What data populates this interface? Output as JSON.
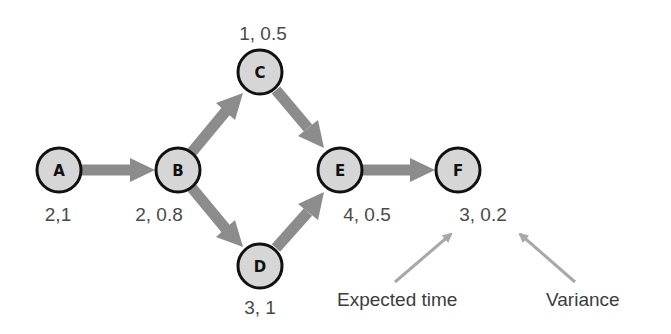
{
  "diagram": {
    "type": "PERT activity network",
    "nodes": [
      {
        "id": "A",
        "label": "A",
        "values": "2,1",
        "expected_time": 2,
        "variance": 1
      },
      {
        "id": "B",
        "label": "B",
        "values": "2, 0.8",
        "expected_time": 2,
        "variance": 0.8
      },
      {
        "id": "C",
        "label": "C",
        "values": "1, 0.5",
        "expected_time": 1,
        "variance": 0.5
      },
      {
        "id": "D",
        "label": "D",
        "values": "3, 1",
        "expected_time": 3,
        "variance": 1
      },
      {
        "id": "E",
        "label": "E",
        "values": "4, 0.5",
        "expected_time": 4,
        "variance": 0.5
      },
      {
        "id": "F",
        "label": "F",
        "values": "3, 0.2",
        "expected_time": 3,
        "variance": 0.2
      }
    ],
    "edges": [
      {
        "from": "A",
        "to": "B"
      },
      {
        "from": "B",
        "to": "C"
      },
      {
        "from": "B",
        "to": "D"
      },
      {
        "from": "C",
        "to": "E"
      },
      {
        "from": "D",
        "to": "E"
      },
      {
        "from": "E",
        "to": "F"
      }
    ],
    "annotations": {
      "expected_time": "Expected time",
      "variance": "Variance"
    },
    "colors": {
      "node_fill": "#d6d6d6",
      "node_stroke": "#111111",
      "edge": "#8c8c8c",
      "annotation_arrow": "#a8a8a8",
      "text": "#4a4a4a"
    }
  }
}
